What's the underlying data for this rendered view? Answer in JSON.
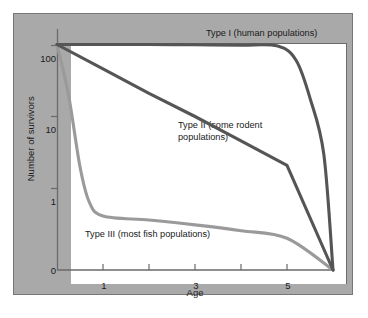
{
  "chart_data": {
    "type": "line",
    "title": "",
    "subtitle": "",
    "xlabel": "Age",
    "ylabel": "Number of survivors",
    "x_ticks": [
      1,
      2,
      3,
      4,
      5,
      6
    ],
    "x_tick_labels": [
      "1",
      "",
      "3",
      "",
      "5",
      ""
    ],
    "xlim": [
      0,
      6
    ],
    "y_ticks": [
      0,
      1,
      10,
      100
    ],
    "y_tick_labels": [
      "0",
      "1",
      "10",
      "100"
    ],
    "ylim_note": "logarithmic from 100 down to 1, then break to 0 at baseline",
    "y_scale": "log",
    "grid": false,
    "legend": "inline annotations on curves",
    "series": [
      {
        "name": "Type I",
        "annotation": "Type I (human populations)",
        "color": "#555555",
        "description": "Stays near 100 survivors through most of lifespan, then drops sharply to 0 near maximum age",
        "points": [
          {
            "age": 0.0,
            "survivors": 100
          },
          {
            "age": 1.0,
            "survivors": 100
          },
          {
            "age": 2.0,
            "survivors": 100
          },
          {
            "age": 3.0,
            "survivors": 99
          },
          {
            "age": 4.0,
            "survivors": 98
          },
          {
            "age": 4.8,
            "survivors": 95
          },
          {
            "age": 5.2,
            "survivors": 60
          },
          {
            "age": 5.5,
            "survivors": 18
          },
          {
            "age": 5.8,
            "survivors": 3
          },
          {
            "age": 6.0,
            "survivors": 0
          }
        ]
      },
      {
        "name": "Type II",
        "annotation": "Type II (some rodent populations)",
        "color": "#555555",
        "description": "Constant rate of mortality; straight line on a log scale from 100 at age 0 to 0 at maximum age",
        "points": [
          {
            "age": 0.0,
            "survivors": 100
          },
          {
            "age": 1.0,
            "survivors": 46
          },
          {
            "age": 2.0,
            "survivors": 21
          },
          {
            "age": 3.0,
            "survivors": 10
          },
          {
            "age": 4.0,
            "survivors": 4.6
          },
          {
            "age": 5.0,
            "survivors": 2.1
          },
          {
            "age": 6.0,
            "survivors": 0
          }
        ]
      },
      {
        "name": "Type III",
        "annotation": "Type III (most fish populations)",
        "color": "#9a9a9a",
        "description": "Very high early mortality; drops from 100 to below 1 within the first age unit, then a low flat tail to 0",
        "points": [
          {
            "age": 0.0,
            "survivors": 100
          },
          {
            "age": 0.25,
            "survivors": 20
          },
          {
            "age": 0.5,
            "survivors": 2
          },
          {
            "age": 0.7,
            "survivors": 0.6
          },
          {
            "age": 1.0,
            "survivors": 0.35
          },
          {
            "age": 2.0,
            "survivors": 0.3
          },
          {
            "age": 3.0,
            "survivors": 0.25
          },
          {
            "age": 4.0,
            "survivors": 0.2
          },
          {
            "age": 5.0,
            "survivors": 0.15
          },
          {
            "age": 6.0,
            "survivors": 0
          }
        ]
      }
    ]
  },
  "annotations": {
    "type1": "Type I (human populations)",
    "type2": "Type II (some rodent\npopulations)",
    "type3": "Type III (most fish populations)"
  },
  "axes": {
    "y_label": "Number of survivors",
    "x_label": "Age",
    "y_100": "100",
    "y_10": "10",
    "y_1": "1",
    "y_0": "0",
    "x_1": "1",
    "x_3": "3",
    "x_5": "5"
  },
  "colors": {
    "panel_background": "#a9a9a9",
    "plot_background": "#ffffff",
    "dark_curve": "#555555",
    "light_curve": "#9a9a9a",
    "axis": "#6a6a6a",
    "text": "#1a1a1a"
  }
}
